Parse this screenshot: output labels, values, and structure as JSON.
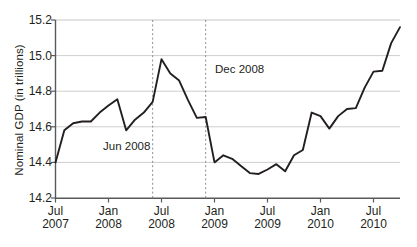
{
  "chart_data": {
    "type": "line",
    "title": "",
    "xlabel": "",
    "ylabel": "Nominal GDP (in trillions)",
    "ylim": [
      14.2,
      15.2
    ],
    "yticks": [
      "14.2",
      "14.4",
      "14.6",
      "14.8",
      "15.0",
      "15.2"
    ],
    "ytick_values": [
      14.2,
      14.4,
      14.6,
      14.8,
      15.0,
      15.2
    ],
    "grid": "horizontal",
    "legend": "none",
    "xticks": [
      {
        "month": "Jul",
        "year": "2007"
      },
      {
        "month": "Jan",
        "year": "2008"
      },
      {
        "month": "Jul",
        "year": "2008"
      },
      {
        "month": "Jan",
        "year": "2009"
      },
      {
        "month": "Jul",
        "year": "2009"
      },
      {
        "month": "Jan",
        "year": "2010"
      },
      {
        "month": "Jul",
        "year": "2010"
      }
    ],
    "x": [
      "Jul 2007",
      "Aug 2007",
      "Sep 2007",
      "Oct 2007",
      "Nov 2007",
      "Dec 2007",
      "Jan 2008",
      "Feb 2008",
      "Mar 2008",
      "Apr 2008",
      "May 2008",
      "Jun 2008",
      "Jul 2008",
      "Aug 2008",
      "Sep 2008",
      "Oct 2008",
      "Nov 2008",
      "Dec 2008",
      "Jan 2009",
      "Feb 2009",
      "Mar 2009",
      "Apr 2009",
      "May 2009",
      "Jun 2009",
      "Jul 2009",
      "Aug 2009",
      "Sep 2009",
      "Oct 2009",
      "Nov 2009",
      "Dec 2009",
      "Jan 2010",
      "Feb 2010",
      "Mar 2010",
      "Apr 2010",
      "May 2010",
      "Jun 2010",
      "Jul 2010",
      "Aug 2010",
      "Sep 2010",
      "Oct 2010"
    ],
    "values": [
      14.4,
      14.58,
      14.62,
      14.63,
      14.63,
      14.68,
      14.72,
      14.755,
      14.58,
      14.64,
      14.68,
      14.74,
      14.98,
      14.9,
      14.86,
      14.75,
      14.65,
      14.655,
      14.4,
      14.44,
      14.42,
      14.38,
      14.34,
      14.335,
      14.36,
      14.39,
      14.35,
      14.44,
      14.47,
      14.68,
      14.66,
      14.59,
      14.66,
      14.7,
      14.705,
      14.82,
      14.91,
      14.915,
      15.07,
      15.16
    ],
    "series_color": "#231f20",
    "grid_color": "#c8c8c8",
    "axis_color": "#58595b",
    "annotations": [
      {
        "name": "jun-2008-marker",
        "label": "Jun 2008",
        "x": "Jun 2008",
        "value": 14.98,
        "style": "dotted-vertical"
      },
      {
        "name": "dec-2008-marker",
        "label": "Dec 2008",
        "x": "Dec 2008",
        "value": 14.4,
        "style": "dotted-vertical"
      }
    ]
  }
}
